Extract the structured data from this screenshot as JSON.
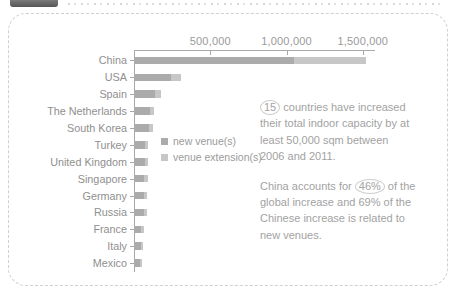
{
  "chart_data": {
    "type": "bar",
    "orientation": "horizontal",
    "axis_position": "top",
    "unit": "sqm",
    "categories": [
      "China",
      "USA",
      "Spain",
      "The Netherlands",
      "South Korea",
      "Turkey",
      "United Kingdom",
      "Singapore",
      "Germany",
      "Russia",
      "France",
      "Italy",
      "Mexico"
    ],
    "series": [
      {
        "name": "new venue(s)",
        "color": "#ababab",
        "values": [
          1050000,
          245000,
          140000,
          105000,
          100000,
          70000,
          70000,
          68000,
          68000,
          65000,
          48000,
          45000,
          40000
        ]
      },
      {
        "name": "venue extension(s)",
        "color": "#c7c7c7",
        "values": [
          470000,
          60000,
          35000,
          25000,
          25000,
          25000,
          22000,
          22000,
          20000,
          20000,
          17000,
          15000,
          13000
        ]
      }
    ],
    "x_ticks": [
      {
        "label": "500,000",
        "value": 500000
      },
      {
        "label": "1,000,000",
        "value": 1000000
      },
      {
        "label": "1,500,000",
        "value": 1500000
      }
    ],
    "xmax": 1580000,
    "grid": false,
    "legend_position": "center-left"
  },
  "notes": {
    "p1": {
      "highlight": "15",
      "line1_rest": " countries have increased",
      "line2": "their total indoor capacity by at",
      "line3": "least 50,000 sqm between",
      "line4": "2006 and 2011."
    },
    "p2": {
      "line1_pre": "China accounts for ",
      "highlight": "46%",
      "line1_rest": " of the",
      "line2": "global increase and 69% of the",
      "line3": "Chinese increase is related to",
      "line4": "new venues."
    }
  },
  "colors": {
    "axis": "#a8a8a8",
    "category_label": "#8f8f8f",
    "tick_label": "#9a9a9a",
    "note_text": "#a2a2a2",
    "panel_border": "#d0d0d0",
    "badge": "#5e5e5e"
  }
}
